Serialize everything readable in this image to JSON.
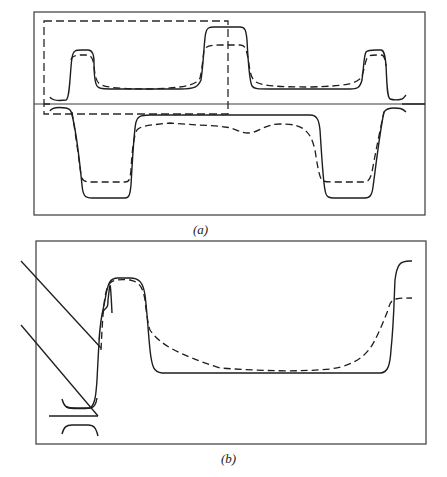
{
  "figure": {
    "panels": [
      {
        "id": "a",
        "label": "(a)",
        "description": "Closed-loop double-valued profile with solid and dashed curves; dashed rectangle highlights left half"
      },
      {
        "id": "b",
        "label": "(b)",
        "description": "Magnified view of highlighted region with solid and dashed curves"
      }
    ],
    "legend": {
      "solid": "solid curve",
      "dashed": "dashed curve"
    },
    "colors": {
      "line": "#1e1e1e",
      "frame": "#3a3a3a",
      "background": "#ffffff"
    }
  }
}
